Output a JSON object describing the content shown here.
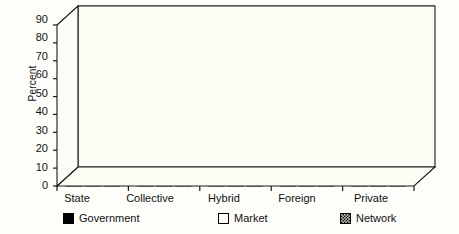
{
  "chart_data": {
    "type": "bar",
    "title": "",
    "subtitle": "",
    "xlabel": "",
    "ylabel": "Percent",
    "ylim": [
      0,
      90
    ],
    "ytick_step": 10,
    "yticks": [
      0,
      10,
      20,
      30,
      40,
      50,
      60,
      70,
      80,
      90
    ],
    "grid": true,
    "three_d": true,
    "legend_position": "bottom",
    "categories": [
      "State",
      "Collective",
      "Hybrid",
      "Foreign",
      "Private"
    ],
    "series": [
      {
        "name": "Government",
        "fill": "solid-black",
        "color": "#000000",
        "values": [
          27,
          9,
          6,
          6,
          2
        ]
      },
      {
        "name": "Market",
        "fill": "white",
        "color": "#FDFDF6",
        "values": [
          68,
          74,
          83,
          84,
          80
        ]
      },
      {
        "name": "Network",
        "fill": "hatch",
        "color": "#B8B8AE",
        "values": [
          9,
          22,
          13,
          12,
          22
        ]
      }
    ]
  },
  "axis": {
    "y_title": "Percent",
    "y_tick_labels": [
      "90",
      "80",
      "70",
      "60",
      "50",
      "40",
      "30",
      "20",
      "10",
      "0"
    ],
    "x_tick_labels": [
      "State",
      "Collective",
      "Hybrid",
      "Foreign",
      "Private"
    ]
  },
  "legend": {
    "items": [
      {
        "label": "Government",
        "swatch": "black-square-icon"
      },
      {
        "label": "Market",
        "swatch": "white-square-icon"
      },
      {
        "label": "Network",
        "swatch": "hatched-square-icon"
      }
    ]
  },
  "colors": {
    "background": "#FDFDFA",
    "plot_face": "#FCFCF4",
    "axis_line": "#1A1A1A",
    "grid_line": "#2B2B2B",
    "government": "#000000",
    "market": "#FDFDF6",
    "network": "#B8B8AE",
    "side_shade": "#8A8A82",
    "top_shade": "#D6D6CE"
  }
}
